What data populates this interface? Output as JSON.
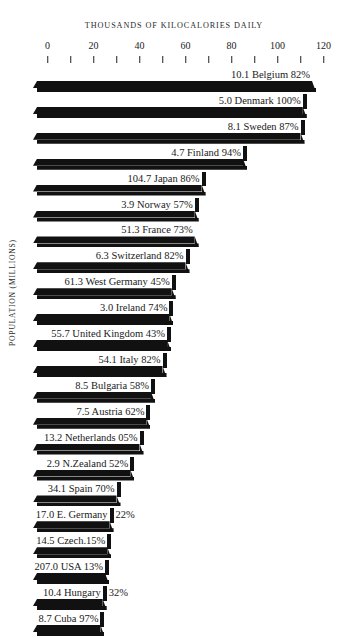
{
  "chart_data": {
    "type": "bar",
    "orientation": "horizontal",
    "title": "Thousands of kilocalories daily",
    "xlabel": "Thousands of kilocalories daily",
    "ylabel": "Population (millions)",
    "xlim": [
      0,
      120
    ],
    "xticks": [
      0,
      10,
      20,
      30,
      40,
      50,
      60,
      70,
      80,
      90,
      100,
      110,
      120
    ],
    "xtick_labels": [
      "0",
      "",
      "20",
      "",
      "40",
      "",
      "60",
      "",
      "80",
      "",
      "100",
      "",
      "120"
    ],
    "grid": false,
    "legend": null,
    "categories": [
      "Belgium",
      "Denmark",
      "Sweden",
      "Finland",
      "Japan",
      "Norway",
      "France",
      "Switzerland",
      "West Germany",
      "Ireland",
      "United Kingdom",
      "Italy",
      "Bulgaria",
      "Austria",
      "Netherlands",
      "N.Zealand",
      "Spain",
      "E. Germany",
      "Czech.",
      "USA",
      "Hungary",
      "Cuba"
    ],
    "values": [
      115,
      111,
      110,
      85,
      67,
      64,
      64,
      60,
      54,
      53,
      52,
      50,
      45,
      43,
      40,
      36,
      30,
      27,
      26,
      25,
      24,
      23
    ],
    "population_millions": [
      10.1,
      5.0,
      8.1,
      4.7,
      104.7,
      3.9,
      51.3,
      6.3,
      61.3,
      3.0,
      55.7,
      54.1,
      8.5,
      7.5,
      13.2,
      2.9,
      34.1,
      17.0,
      14.5,
      207.0,
      10.4,
      8.7
    ],
    "percent": [
      "82%",
      "100%",
      "87%",
      "94%",
      "86%",
      "57%",
      "73%",
      "82%",
      "45%",
      "74%",
      "43%",
      "82%",
      "58%",
      "62%",
      "05%",
      "52%",
      "70%",
      "22%",
      "15%",
      "13%",
      "32%",
      "97%"
    ],
    "rows": [
      {
        "label": "10.1 Belgium 82%",
        "pct_outside": "",
        "value": 115
      },
      {
        "label": "5.0 Denmark 100%",
        "pct_outside": "",
        "value": 111
      },
      {
        "label": "8.1 Sweden 87%",
        "pct_outside": "",
        "value": 110
      },
      {
        "label": "4.7 Finland 94%",
        "pct_outside": "",
        "value": 85
      },
      {
        "label": "104.7 Japan 86%",
        "pct_outside": "",
        "value": 67
      },
      {
        "label": "3.9 Norway 57%",
        "pct_outside": "",
        "value": 64
      },
      {
        "label": "51.3 France 73%",
        "pct_outside": "",
        "value": 64
      },
      {
        "label": "6.3 Switzerland 82%",
        "pct_outside": "",
        "value": 60
      },
      {
        "label": "61.3 West Germany 45%",
        "pct_outside": "",
        "value": 54
      },
      {
        "label": "3.0 Ireland 74%",
        "pct_outside": "",
        "value": 53
      },
      {
        "label": "55.7 United Kingdom 43%",
        "pct_outside": "",
        "value": 52
      },
      {
        "label": "54.1 Italy 82%",
        "pct_outside": "",
        "value": 50
      },
      {
        "label": "8.5 Bulgaria 58%",
        "pct_outside": "",
        "value": 45
      },
      {
        "label": "7.5 Austria 62%",
        "pct_outside": "",
        "value": 43
      },
      {
        "label": "13.2 Netherlands 05%",
        "pct_outside": "",
        "value": 40
      },
      {
        "label": "2.9 N.Zealand 52%",
        "pct_outside": "",
        "value": 36
      },
      {
        "label": "34.1 Spain 70%",
        "pct_outside": "",
        "value": 30
      },
      {
        "label": "17.0 E. Germany",
        "pct_outside": "22%",
        "value": 27
      },
      {
        "label": "14.5 Czech.15%",
        "pct_outside": "",
        "value": 26
      },
      {
        "label": "207.0 USA 13%",
        "pct_outside": "",
        "value": 25
      },
      {
        "label": "10.4 Hungary",
        "pct_outside": "32%",
        "value": 24
      },
      {
        "label": "8.7 Cuba 97%",
        "pct_outside": "",
        "value": 23
      }
    ],
    "colors": {
      "bar": "#111111",
      "text": "#1a1a1a",
      "axis": "#222222",
      "background": "#ffffff"
    }
  }
}
